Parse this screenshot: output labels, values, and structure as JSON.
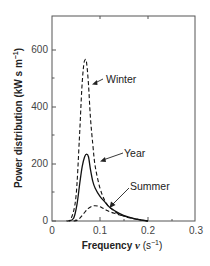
{
  "chart_data": {
    "type": "line",
    "title": "",
    "xlabel": "Frequency ν (s⁻¹)",
    "ylabel": "Power distribution (kW s m⁻¹)",
    "xlim": [
      0,
      0.3
    ],
    "ylim": [
      0,
      750
    ],
    "xticks": [
      0,
      0.1,
      0.2,
      0.3
    ],
    "xtick_labels": [
      "0",
      "0.1",
      "0.2",
      "0.3"
    ],
    "yticks": [
      0,
      200,
      400,
      600
    ],
    "ytick_labels": [
      "0",
      "200",
      "400",
      "600"
    ],
    "minor_yticks": [
      100,
      300,
      500
    ],
    "grid": false,
    "legend": "none (direct annotations with arrows)",
    "series": [
      {
        "name": "Winter",
        "style": "dashed",
        "x": [
          0.03,
          0.04,
          0.05,
          0.057,
          0.062,
          0.066,
          0.069,
          0.072,
          0.076,
          0.08,
          0.085,
          0.09,
          0.1,
          0.11,
          0.12,
          0.14,
          0.16,
          0.18,
          0.2
        ],
        "values": [
          0,
          10,
          90,
          300,
          480,
          570,
          590,
          580,
          500,
          380,
          280,
          200,
          120,
          75,
          50,
          25,
          12,
          5,
          0
        ]
      },
      {
        "name": "Year",
        "style": "solid",
        "x": [
          0.035,
          0.045,
          0.052,
          0.058,
          0.063,
          0.068,
          0.072,
          0.076,
          0.08,
          0.085,
          0.09,
          0.1,
          0.11,
          0.12,
          0.14,
          0.16,
          0.18,
          0.2
        ],
        "values": [
          0,
          10,
          60,
          140,
          200,
          235,
          245,
          235,
          190,
          145,
          120,
          90,
          70,
          50,
          28,
          14,
          5,
          0
        ]
      },
      {
        "name": "Summer",
        "style": "dashed",
        "x": [
          0.045,
          0.055,
          0.065,
          0.075,
          0.085,
          0.095,
          0.105,
          0.115,
          0.13,
          0.15,
          0.17,
          0.19,
          0.2
        ],
        "values": [
          0,
          5,
          25,
          45,
          55,
          55,
          48,
          38,
          28,
          18,
          9,
          3,
          0
        ]
      }
    ],
    "annotations": [
      {
        "text": "Winter",
        "points_to": "Winter",
        "at_x": 0.085,
        "at_y": 470
      },
      {
        "text": "Year",
        "points_to": "Year",
        "at_x": 0.09,
        "at_y": 150
      },
      {
        "text": "Summer",
        "points_to": "Summer",
        "at_x": 0.11,
        "at_y": 35
      }
    ]
  },
  "labels": {
    "xlabel_main": "Frequency ",
    "xlabel_symbol": "ν",
    "xlabel_unit": " (s",
    "xlabel_sup": "−1",
    "xlabel_close": ")",
    "ylabel_main": "Power distribution (kW s m",
    "ylabel_sup": "−1",
    "ylabel_close": ")",
    "winter": "Winter",
    "year": "Year",
    "summer": "Summer",
    "xtick_0": "0",
    "xtick_1": "0.1",
    "xtick_2": "0.2",
    "xtick_3": "0.3",
    "ytick_0": "0",
    "ytick_200": "200",
    "ytick_400": "400",
    "ytick_600": "600"
  }
}
